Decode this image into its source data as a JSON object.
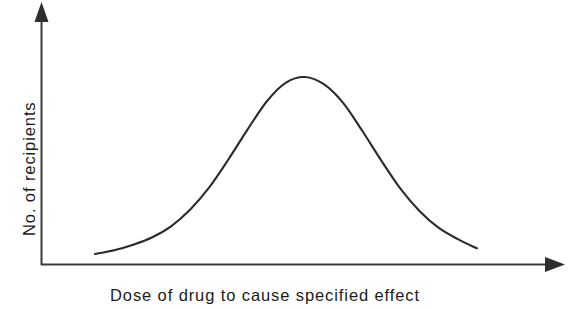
{
  "chart_data": {
    "type": "line",
    "title": "",
    "subtitle": "",
    "xlabel": "Dose of drug to cause specified effect",
    "ylabel": "No. of recipients",
    "grid": false,
    "legend": false,
    "legend_position": "none",
    "annotations": [],
    "xticks": [],
    "yticks": [],
    "xtick_labels": [],
    "ytick_labels": [],
    "xlim": [
      0,
      10
    ],
    "ylim": [
      0,
      1.15
    ],
    "series": [
      {
        "name": "Frequency distribution of dose response",
        "x": [
          0.0,
          0.5,
          1.0,
          1.5,
          2.0,
          2.5,
          3.0,
          3.5,
          4.0,
          4.5,
          5.0,
          5.5,
          6.0,
          6.5,
          7.0,
          7.5,
          8.0,
          8.5,
          9.0,
          9.5,
          10.0
        ],
        "y": [
          0.05,
          0.07,
          0.1,
          0.14,
          0.2,
          0.29,
          0.41,
          0.56,
          0.72,
          0.87,
          0.97,
          1.0,
          0.96,
          0.86,
          0.71,
          0.55,
          0.4,
          0.28,
          0.19,
          0.13,
          0.08
        ]
      }
    ]
  },
  "axes": {
    "x_arrow": "arrow-right",
    "y_arrow": "arrow-up",
    "line_color": "#3a3a3a",
    "curve_color": "#2b2b2b"
  }
}
